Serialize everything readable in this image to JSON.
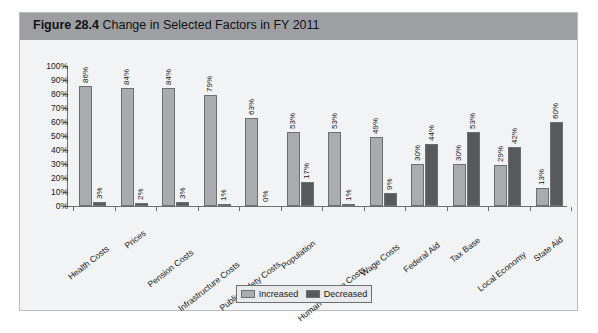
{
  "figure": {
    "label": "Figure 28.4",
    "title": "Change in Selected Factors in FY 2011"
  },
  "legend": {
    "increased_label": "Increased",
    "decreased_label": "Decreased"
  },
  "colors": {
    "increased": "#a9abad",
    "decreased": "#58595b",
    "header_band": "#9d9fa2",
    "figure_background": "#f2f3f5",
    "axis": "#6d7073"
  },
  "chart_data": {
    "type": "bar",
    "title": "Change in Selected Factors in FY 2011",
    "xlabel": "",
    "ylabel": "",
    "ylim": [
      0,
      100
    ],
    "grid": false,
    "legend_position": "bottom",
    "y_ticks": [
      "0%",
      "10%",
      "20%",
      "30%",
      "40%",
      "50%",
      "60%",
      "70%",
      "80%",
      "90%",
      "100%"
    ],
    "categories": [
      "Health Costs",
      "Prices",
      "Pension Costs",
      "Infrastructure Costs",
      "Public Safety Costs",
      "Population",
      "Human Service Costs",
      "Wage Costs",
      "Federal Aid",
      "Tax Base",
      "Local Economy",
      "State Aid"
    ],
    "series": [
      {
        "name": "Increased",
        "values": [
          86,
          84,
          84,
          79,
          63,
          53,
          53,
          49,
          30,
          30,
          29,
          13
        ],
        "labels": [
          "86%",
          "84%",
          "84%",
          "79%",
          "63%",
          "53%",
          "53%",
          "49%",
          "30%",
          "30%",
          "29%",
          "13%"
        ]
      },
      {
        "name": "Decreased",
        "values": [
          3,
          2,
          3,
          1,
          0,
          17,
          1,
          9,
          44,
          53,
          42,
          60
        ],
        "labels": [
          "3%",
          "2%",
          "3%",
          "1%",
          "0%",
          "17%",
          "1%",
          "9%",
          "44%",
          "53%",
          "42%",
          "60%"
        ]
      }
    ]
  }
}
